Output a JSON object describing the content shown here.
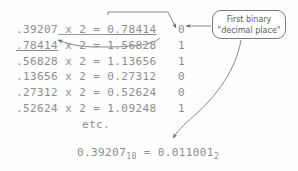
{
  "diagram": {
    "line_color": "#7c7c7c",
    "text_color": "#8d8d8d",
    "callout_text_color": "#5d5d5d",
    "background": "#fefefe"
  },
  "rows": [
    {
      "fraction": ".39207",
      "operator": " x 2 = ",
      "product": "0.78414",
      "bit": "0"
    },
    {
      "fraction": ".78414",
      "operator": " x 2 = ",
      "product": "1.56828",
      "bit": "1"
    },
    {
      "fraction": ".56828",
      "operator": " x 2 = ",
      "product": "1.13656",
      "bit": "1"
    },
    {
      "fraction": ".13656",
      "operator": " x 2 = ",
      "product": "0.27312",
      "bit": "0"
    },
    {
      "fraction": ".27312",
      "operator": " x 2 = ",
      "product": "0.52624",
      "bit": "0"
    },
    {
      "fraction": ".52624",
      "operator": " x 2 = ",
      "product": "1.09248",
      "bit": "1"
    }
  ],
  "etc_label": "etc.",
  "result": {
    "decimal_value": "0.39207",
    "decimal_base": "10",
    "equals": " = ",
    "binary_value": "0.011001",
    "binary_base": "2"
  },
  "callout": {
    "line1": "First binary",
    "line2": "\"decimal place\""
  }
}
